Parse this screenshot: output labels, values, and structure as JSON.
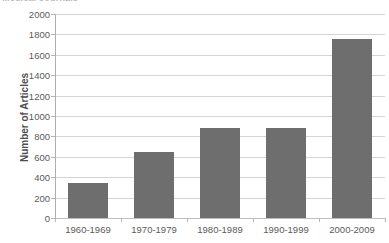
{
  "title_fragment": "Medical Journals",
  "chart_data": {
    "type": "bar",
    "title": "",
    "xlabel": "",
    "ylabel": "Number of Articles",
    "categories": [
      "1960-1969",
      "1970-1979",
      "1980-1989",
      "1990-1999",
      "2000-2009"
    ],
    "values": [
      340,
      650,
      880,
      885,
      1755
    ],
    "ylim": [
      0,
      2000
    ],
    "ytick_step": 200,
    "yticks": [
      0,
      200,
      400,
      600,
      800,
      1000,
      1200,
      1400,
      1600,
      1800,
      2000
    ],
    "ytick_labels": [
      "0",
      "200",
      "400",
      "600",
      "800",
      "1000",
      "1200",
      "1400",
      "1600",
      "1800",
      "2000"
    ],
    "grid": true,
    "legend": false,
    "legend_position": "none",
    "bar_color": "#6e6e6e",
    "gridline_color": "#d4d4d4",
    "axis_color": "#aeaeae",
    "background_color": "#ffffff",
    "text_color": "#5a5a5a"
  }
}
